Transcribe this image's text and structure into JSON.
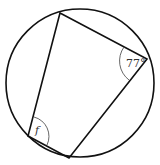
{
  "diagram": {
    "type": "cyclic-quadrilateral",
    "circle": {
      "cx": 80,
      "cy": 83,
      "r": 74
    },
    "vertices": {
      "top": [
        60,
        13
      ],
      "right": [
        147,
        59
      ],
      "bottom": [
        69,
        158
      ],
      "left": [
        28,
        136
      ]
    },
    "angles": [
      {
        "vertex": "right",
        "label": "77°"
      },
      {
        "vertex": "left",
        "label": "f"
      }
    ],
    "colors": {
      "stroke": "#111111",
      "arc": "#555555"
    }
  }
}
